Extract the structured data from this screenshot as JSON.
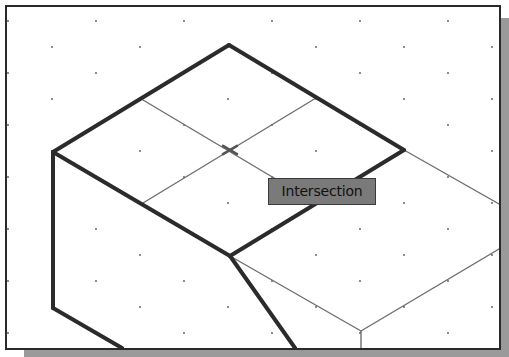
{
  "viewport": {
    "background": "#ffffff",
    "border_color": "#2a2a2a",
    "shadow_color": "#9a9a9a"
  },
  "grid": {
    "type": "isometric-snap-dots",
    "dot_color": "#555555",
    "spacing_x": 88,
    "spacing_y": 26,
    "stagger": 44
  },
  "geometry": {
    "thick_line_color": "#2b2b2b",
    "thin_line_color": "#6e6e6e",
    "thick_edges": [
      [
        [
          53,
          152
        ],
        [
          229,
          45
        ]
      ],
      [
        [
          229,
          45
        ],
        [
          404,
          150
        ]
      ],
      [
        [
          53,
          152
        ],
        [
          230,
          256
        ]
      ],
      [
        [
          404,
          150
        ],
        [
          230,
          256
        ]
      ],
      [
        [
          53,
          152
        ],
        [
          53,
          308
        ]
      ],
      [
        [
          53,
          308
        ],
        [
          122,
          348
        ]
      ],
      [
        [
          230,
          256
        ],
        [
          295,
          348
        ]
      ]
    ],
    "thin_edges": [
      [
        [
          143,
          100
        ],
        [
          316,
          203
        ]
      ],
      [
        [
          143,
          203
        ],
        [
          316,
          98
        ]
      ],
      [
        [
          404,
          150
        ],
        [
          499,
          204
        ]
      ],
      [
        [
          230,
          256
        ],
        [
          361,
          331
        ]
      ],
      [
        [
          361,
          331
        ],
        [
          499,
          249
        ]
      ],
      [
        [
          361,
          331
        ],
        [
          361,
          348
        ]
      ]
    ]
  },
  "osnap": {
    "marker": "intersection-x-marker",
    "position": [
      230,
      150
    ],
    "tooltip_label": "Intersection"
  }
}
